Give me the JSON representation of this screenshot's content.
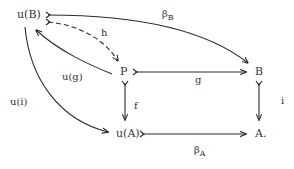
{
  "diagram": {
    "type": "commutative-diagram",
    "nodes": {
      "uB": "u(B)",
      "P": "P",
      "B": "B",
      "uA": "u(A)",
      "A": "A."
    },
    "edges": {
      "beta_B": {
        "label": "β",
        "sub": "B",
        "from": "u(B)",
        "to": "B",
        "style": "solid",
        "tail": "mono"
      },
      "h": {
        "label": "h",
        "from": "u(B)",
        "to": "P",
        "style": "dashed",
        "tail": "mono"
      },
      "u_g": {
        "label": "u(g)",
        "from": "P",
        "to": "u(B)",
        "style": "solid"
      },
      "g": {
        "label": "g",
        "from": "P",
        "to": "B",
        "style": "solid",
        "tail": "mono"
      },
      "f": {
        "label": "f",
        "from": "P",
        "to": "u(A)",
        "style": "solid",
        "tail": "mono"
      },
      "i": {
        "label": "i",
        "from": "B",
        "to": "A.",
        "style": "solid",
        "tail": "mono"
      },
      "u_i": {
        "label": "u(i)",
        "from": "u(B)",
        "to": "u(A)",
        "style": "solid"
      },
      "beta_A": {
        "label": "β",
        "sub": "A",
        "from": "u(A)",
        "to": "A.",
        "style": "solid",
        "tail": "mono"
      }
    }
  }
}
